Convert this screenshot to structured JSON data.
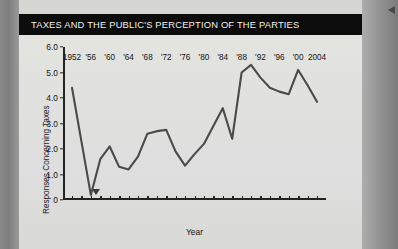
{
  "figure": {
    "title": "TAXES AND THE PUBLIC'S PERCEPTION OF THE PARTIES",
    "title_bar_color": "#0c0c0c",
    "title_text_color": "#f2f2ef",
    "page_background": "#e2e2df",
    "line_color": "#4a4a4a"
  },
  "chart_data": {
    "type": "line",
    "title": "TAXES AND THE PUBLIC'S PERCEPTION OF THE PARTIES",
    "xlabel": "Year",
    "ylabel": "Responses Concerning Taxes",
    "xlim": [
      1952,
      2004
    ],
    "ylim": [
      0,
      6.0
    ],
    "grid": false,
    "legend": null,
    "ytick_labels": [
      "0",
      "1.0",
      "2.0",
      "3.0",
      "4.0",
      "5.0",
      "6.0"
    ],
    "ytick_values": [
      0,
      1.0,
      2.0,
      3.0,
      4.0,
      5.0,
      6.0
    ],
    "xtick_labels": [
      "1952",
      "'56",
      "'60",
      "'64",
      "'68",
      "'72",
      "'76",
      "'80",
      "'84",
      "'88",
      "'92",
      "'96",
      "'00",
      "2004"
    ],
    "xtick_values": [
      1952,
      1956,
      1960,
      1964,
      1968,
      1972,
      1976,
      1980,
      1984,
      1988,
      1992,
      1996,
      2000,
      2004
    ],
    "minor_xticks_every": 2,
    "x": [
      1952,
      1954,
      1956,
      1958,
      1960,
      1962,
      1964,
      1966,
      1968,
      1970,
      1972,
      1974,
      1976,
      1978,
      1980,
      1982,
      1984,
      1986,
      1988,
      1990,
      1992,
      1994,
      1996,
      1998,
      2000,
      2002,
      2004
    ],
    "values": [
      4.4,
      2.3,
      0.2,
      1.6,
      2.1,
      1.3,
      1.2,
      1.7,
      2.6,
      2.7,
      2.75,
      1.9,
      1.35,
      1.8,
      2.2,
      2.9,
      3.6,
      2.4,
      5.0,
      5.3,
      4.8,
      4.4,
      4.25,
      4.15,
      5.1,
      4.5,
      3.85
    ],
    "series": [
      {
        "name": "Responses Concerning Taxes",
        "values": [
          4.4,
          2.3,
          0.2,
          1.6,
          2.1,
          1.3,
          1.2,
          1.7,
          2.6,
          2.7,
          2.75,
          1.9,
          1.35,
          1.8,
          2.2,
          2.9,
          3.6,
          2.4,
          5.0,
          5.3,
          4.8,
          4.4,
          4.25,
          4.15,
          5.1,
          4.5,
          3.85
        ]
      }
    ],
    "annotations": [
      {
        "name": "axis-marker-triangle",
        "x": 1957,
        "symbol": "▼"
      }
    ]
  }
}
